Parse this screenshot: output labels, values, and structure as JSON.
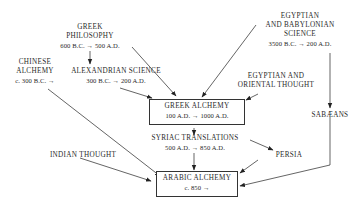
{
  "diagram": {
    "nodes": {
      "greek_philosophy": {
        "name_l1": "GREEK",
        "name_l2": "PHILOSOPHY",
        "dates": "600 B.C. → 500 A.D."
      },
      "egyptian_babylonian": {
        "name_l1": "EGYPTIAN",
        "name_l2": "AND BABYLONIAN",
        "name_l3": "SCIENCE",
        "dates": "3500 B.C. → 200 A.D."
      },
      "chinese_alchemy": {
        "name_l1": "CHINESE",
        "name_l2": "ALCHEMY",
        "dates": "c. 300 B.C. →"
      },
      "alexandrian_science": {
        "name_l1": "ALEXANDRIAN SCIENCE",
        "dates": "300 B.C. → 200 A.D."
      },
      "egyptian_oriental": {
        "name_l1": "EGYPTIAN AND",
        "name_l2": "ORIENTAL THOUGHT"
      },
      "greek_alchemy": {
        "name_l1": "GREEK ALCHEMY",
        "dates": "100 A.D. → 1000 A.D."
      },
      "sabaeans": {
        "name_l1": "SABÆANS"
      },
      "syriac_translations": {
        "name_l1": "SYRIAC TRANSLATIONS",
        "dates": "500 A.D. → 850 A.D."
      },
      "persia": {
        "name_l1": "PERSIA"
      },
      "indian_thought": {
        "name_l1": "INDIAN THOUGHT"
      },
      "arabic_alchemy": {
        "name_l1": "ARABIC ALCHEMY",
        "dates": "c. 850 →"
      }
    },
    "edges": [
      [
        "greek_philosophy",
        "alexandrian_science"
      ],
      [
        "greek_philosophy",
        "greek_alchemy"
      ],
      [
        "alexandrian_science",
        "greek_alchemy"
      ],
      [
        "egyptian_babylonian",
        "greek_alchemy"
      ],
      [
        "egyptian_babylonian",
        "sabaeans"
      ],
      [
        "egyptian_oriental",
        "greek_alchemy"
      ],
      [
        "chinese_alchemy",
        "arabic_alchemy"
      ],
      [
        "greek_alchemy",
        "syriac_translations"
      ],
      [
        "syriac_translations",
        "persia"
      ],
      [
        "syriac_translations",
        "arabic_alchemy"
      ],
      [
        "persia",
        "arabic_alchemy"
      ],
      [
        "sabaeans",
        "arabic_alchemy"
      ],
      [
        "indian_thought",
        "arabic_alchemy"
      ]
    ]
  }
}
